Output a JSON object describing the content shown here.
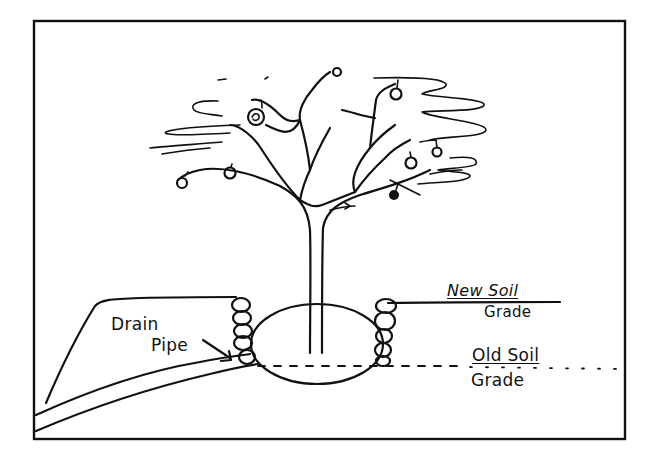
{
  "diagram": {
    "colors": {
      "ink": "#111111",
      "background": "#ffffff"
    },
    "labels": {
      "drain_pipe_line1": "Drain",
      "drain_pipe_line2": "Pipe",
      "new_soil_line1": "New Soil",
      "new_soil_line2": "Grade",
      "old_soil_line1": "Old Soil",
      "old_soil_line2": "Grade"
    },
    "elements": [
      {
        "name": "frame",
        "type": "rectangle"
      },
      {
        "name": "tree-trunk",
        "type": "stroke"
      },
      {
        "name": "tree-branches",
        "type": "stroke"
      },
      {
        "name": "fruits",
        "count": 9
      },
      {
        "name": "foliage-squiggles",
        "count": 7
      },
      {
        "name": "root-ball",
        "type": "ellipse"
      },
      {
        "name": "left-rock-wall",
        "stones": 5
      },
      {
        "name": "right-rock-wall",
        "stones": 5
      },
      {
        "name": "new-soil-grade-line",
        "type": "line"
      },
      {
        "name": "old-soil-grade-line",
        "type": "dashed-line"
      },
      {
        "name": "drain-pipe",
        "type": "double-curve"
      },
      {
        "name": "drain-pipe-arrow",
        "type": "arrow"
      }
    ]
  }
}
